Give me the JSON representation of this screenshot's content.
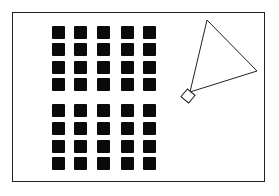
{
  "figure": {
    "frame": {
      "x": 12,
      "y": 12,
      "width": 253,
      "height": 170,
      "stroke": "#222222"
    },
    "squares": {
      "rows": 8,
      "cols": 5,
      "color": "#0a0a0a",
      "size": 13,
      "col_x": [
        52,
        74,
        97,
        121,
        143
      ],
      "row_y": [
        26,
        43,
        61,
        78,
        104,
        122,
        140,
        157
      ]
    },
    "triangle": {
      "points": [
        [
          207,
          20
        ],
        [
          257,
          71
        ],
        [
          190,
          92
        ]
      ],
      "stroke": "#222222"
    },
    "diamond": {
      "cx": 188,
      "cy": 96,
      "size": 10,
      "stroke": "#222222"
    }
  }
}
